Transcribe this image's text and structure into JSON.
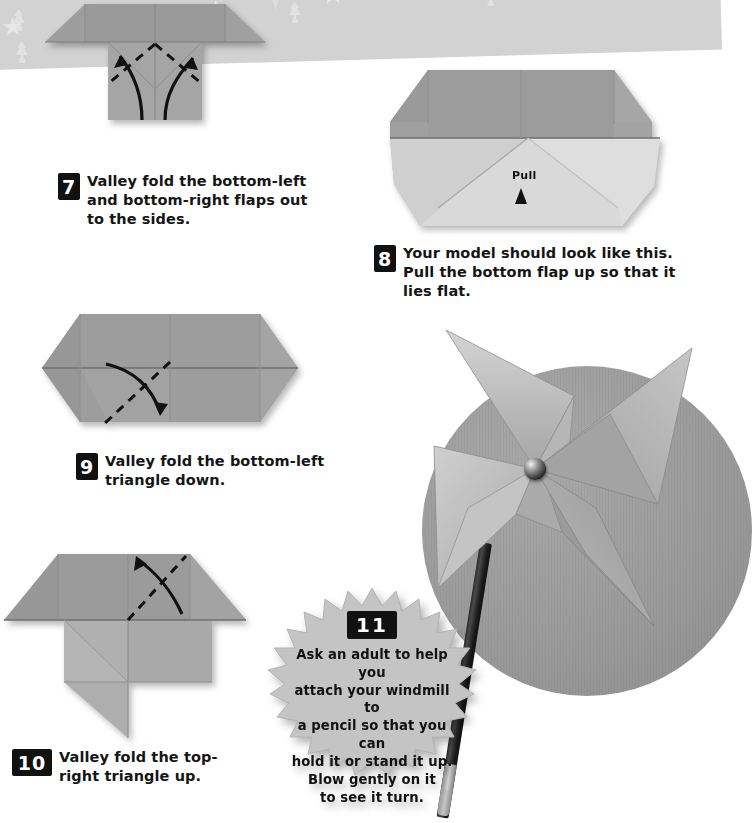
{
  "page": {
    "background_color": "#ffffff",
    "banner_color": "#d2d2d2",
    "paper_color": "#9a9a9a",
    "accent_color": "#111111"
  },
  "banner": {
    "name": "decorative-star-banner",
    "motifs": [
      "star",
      "star",
      "pinwheel",
      "tree",
      "star",
      "tree",
      "star",
      "pinwheel",
      "star"
    ]
  },
  "steps": [
    {
      "number": "7",
      "text": "Valley fold the bottom-left\nand bottom-right flaps out\nto the sides.",
      "figure_name": "origami-diagram-step-7"
    },
    {
      "number": "8",
      "text": "Your model should look like this.\nPull the bottom flap up so that it lies flat.",
      "figure_name": "origami-diagram-step-8",
      "annotation": "Pull"
    },
    {
      "number": "9",
      "text": "Valley fold the bottom-left\ntriangle down.",
      "figure_name": "origami-diagram-step-9"
    },
    {
      "number": "10",
      "text": "Valley fold the top-\nright triangle up.",
      "figure_name": "origami-diagram-step-10"
    }
  ],
  "final_step": {
    "number": "11",
    "text": "Ask an adult to help you\nattach your windmill to\na pencil so that you can\nhold it or stand it up.\nBlow gently on it\nto see it turn."
  },
  "photo": {
    "name": "finished-windmill-photo",
    "subject": "paper pinwheel windmill pinned to a pencil"
  }
}
